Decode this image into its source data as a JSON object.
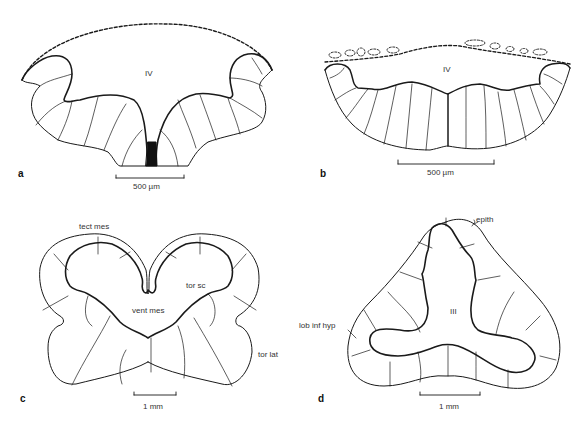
{
  "figure": {
    "panels": [
      {
        "id": "a",
        "letter": "a",
        "labels": {
          "ventricle": "IV"
        },
        "scale_bar": "500 µm"
      },
      {
        "id": "b",
        "letter": "b",
        "labels": {
          "ventricle": "IV"
        },
        "scale_bar": "500 µm"
      },
      {
        "id": "c",
        "letter": "c",
        "labels": {
          "tect_mes": "tect mes",
          "tor_sc": "tor sc",
          "vent_mes": "vent mes",
          "tor_lat": "tor lat"
        },
        "scale_bar": "1 mm"
      },
      {
        "id": "d",
        "letter": "d",
        "labels": {
          "epith": "epith",
          "ventricle": "III",
          "lob_inf_hyp": "lob inf hyp"
        },
        "scale_bar": "1 mm"
      }
    ],
    "colors": {
      "line": "#1a1a1a",
      "fill_black": "#111111",
      "background": "#ffffff"
    }
  }
}
